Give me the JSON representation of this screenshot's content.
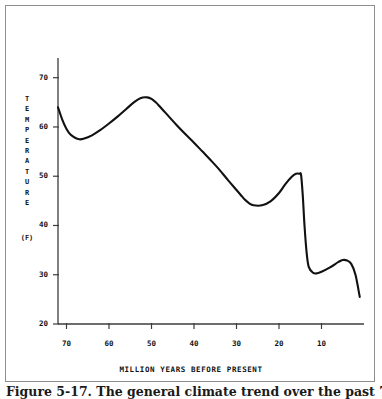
{
  "figure": {
    "caption": "Figure 5-17.  The general climate trend over the past 70 million years."
  },
  "chart_data": {
    "type": "line",
    "title": "",
    "xlabel": "MILLION YEARS BEFORE PRESENT",
    "ylabel": "TEMPERATURE",
    "ylabel_letters": [
      "T",
      "E",
      "M",
      "P",
      "E",
      "R",
      "A",
      "T",
      "U",
      "R",
      "E"
    ],
    "yunits": "(F)",
    "xlim": [
      72,
      0
    ],
    "ylim": [
      20,
      74
    ],
    "x_axis_inverted": true,
    "grid": false,
    "legend": null,
    "line_color": "#111111",
    "xticks": [
      70,
      60,
      50,
      40,
      30,
      20,
      10
    ],
    "xtick_labels": [
      "70",
      "60",
      "50",
      "40",
      "30",
      "20",
      "10"
    ],
    "yticks": [
      20,
      30,
      40,
      50,
      60,
      70
    ],
    "ytick_labels": [
      "20",
      "30",
      "40",
      "50",
      "60",
      "70"
    ],
    "series": [
      {
        "name": "Global temperature",
        "x": [
          72.0,
          71.0,
          70.0,
          69.0,
          68.0,
          67.0,
          66.0,
          64.0,
          62.0,
          60.0,
          58.0,
          56.0,
          54.0,
          52.5,
          51.0,
          50.0,
          49.0,
          48.0,
          46.0,
          44.0,
          42.0,
          40.0,
          38.0,
          36.0,
          34.0,
          32.0,
          30.0,
          29.0,
          28.0,
          27.0,
          26.0,
          24.0,
          22.0,
          20.0,
          18.5,
          17.0,
          16.0,
          15.2,
          14.8,
          14.4,
          14.0,
          13.5,
          13.0,
          12.0,
          11.0,
          10.0,
          8.0,
          6.0,
          5.0,
          4.0,
          3.0,
          2.0,
          1.0
        ],
        "y": [
          64.0,
          61.5,
          59.6,
          58.4,
          57.8,
          57.5,
          57.6,
          58.3,
          59.4,
          60.7,
          62.1,
          63.6,
          65.1,
          65.9,
          66.0,
          65.7,
          65.0,
          64.1,
          62.2,
          60.3,
          58.5,
          56.8,
          55.0,
          53.2,
          51.3,
          49.2,
          47.2,
          46.2,
          45.2,
          44.5,
          44.1,
          44.1,
          44.9,
          46.6,
          48.4,
          49.9,
          50.5,
          50.5,
          50.2,
          46.0,
          40.0,
          34.5,
          31.6,
          30.4,
          30.3,
          30.6,
          31.5,
          32.6,
          33.0,
          32.9,
          32.2,
          30.0,
          25.5
        ]
      }
    ]
  }
}
